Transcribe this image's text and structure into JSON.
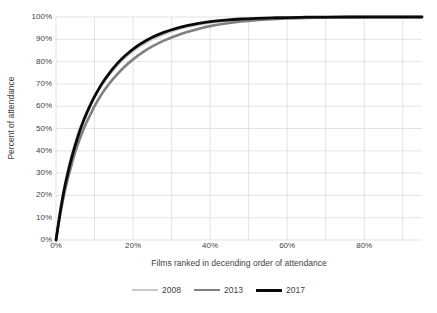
{
  "chart_data": {
    "type": "line",
    "title": "",
    "subtitle": "",
    "xlabel": "Films ranked in decending order of attendance",
    "ylabel": "Percent of attendance",
    "xlim": [
      0,
      95
    ],
    "ylim": [
      0,
      100
    ],
    "grid": true,
    "legend_position": "bottom",
    "xticks": [
      0,
      20,
      40,
      60,
      80
    ],
    "xtick_labels": [
      "0%",
      "20%",
      "40%",
      "60%",
      "80%"
    ],
    "x_gridlines": [
      0,
      10,
      20,
      30,
      40,
      50,
      60,
      70,
      80,
      90
    ],
    "yticks": [
      0,
      10,
      20,
      30,
      40,
      50,
      60,
      70,
      80,
      90,
      100
    ],
    "ytick_labels": [
      "0%",
      "10%",
      "20%",
      "30%",
      "40%",
      "50%",
      "60%",
      "70%",
      "80%",
      "90%",
      "100%"
    ],
    "x": [
      0,
      1,
      2,
      3,
      4,
      5,
      6,
      7,
      8,
      9,
      10,
      12,
      14,
      16,
      18,
      20,
      22,
      25,
      28,
      31,
      34,
      37,
      40,
      44,
      48,
      52,
      56,
      60,
      65,
      70,
      75,
      80,
      85,
      90,
      95
    ],
    "series": [
      {
        "name": "2008",
        "color": "#c9c9c9",
        "width": 2.6,
        "values": [
          0,
          12,
          22,
          30.5,
          37.5,
          43.5,
          49,
          53.5,
          57.5,
          61,
          64.5,
          70,
          74.5,
          78.5,
          82,
          84.8,
          87.2,
          90.1,
          92.4,
          94.2,
          95.6,
          96.6,
          97.4,
          98.2,
          98.8,
          99.2,
          99.4,
          99.6,
          99.8,
          99.9,
          100,
          100,
          100,
          100,
          100
        ]
      },
      {
        "name": "2013",
        "color": "#808080",
        "width": 2.6,
        "values": [
          0,
          10.5,
          19.5,
          27,
          33.5,
          39.5,
          44.5,
          49,
          53,
          56.5,
          60,
          65.8,
          70.5,
          74.5,
          78,
          81,
          83.6,
          86.8,
          89.4,
          91.5,
          93.3,
          94.7,
          95.9,
          97.1,
          98,
          98.6,
          99,
          99.3,
          99.6,
          99.8,
          99.9,
          100,
          100,
          100,
          100
        ]
      },
      {
        "name": "2017",
        "color": "#0a0a0a",
        "width": 2.8,
        "values": [
          0,
          11.5,
          21.5,
          29.5,
          36.5,
          42.5,
          48,
          52.8,
          57,
          60.8,
          64.3,
          70.3,
          75.2,
          79.3,
          82.7,
          85.6,
          88,
          90.9,
          93.1,
          94.8,
          96.1,
          97.1,
          97.9,
          98.6,
          99.1,
          99.4,
          99.6,
          99.75,
          99.9,
          99.95,
          100,
          100,
          100,
          100,
          100
        ]
      }
    ]
  },
  "axes": {
    "x_title": "Films ranked in decending order of attendance",
    "y_title": "Percent of attendance"
  },
  "legend": {
    "items": [
      {
        "label": "2008",
        "color": "#c9c9c9"
      },
      {
        "label": "2013",
        "color": "#808080"
      },
      {
        "label": "2017",
        "color": "#0a0a0a"
      }
    ]
  }
}
